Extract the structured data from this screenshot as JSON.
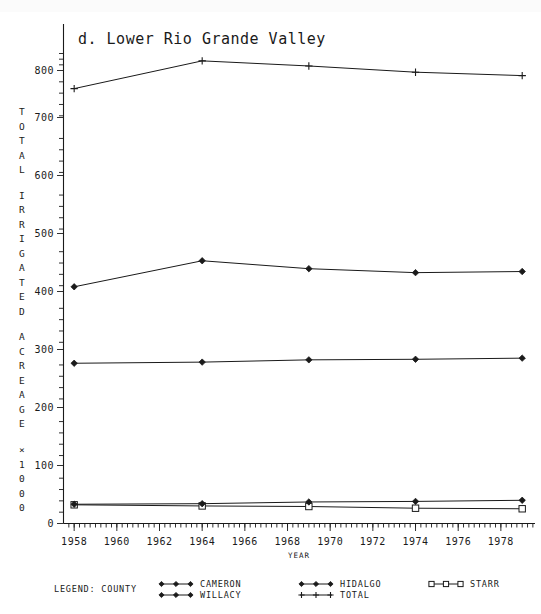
{
  "chart_data": {
    "type": "line",
    "title": "d. Lower Rio Grande Valley",
    "xlabel": "YEAR",
    "ylabel": "TOTAL IRRIGATED ACREAGE",
    "ylabel_units": "1000",
    "ylabel_multiplier_symbol": "×",
    "x": [
      1958,
      1964,
      1969,
      1974,
      1979
    ],
    "xlim": [
      1957.5,
      1979.5
    ],
    "ylim": [
      0,
      830
    ],
    "xticks": [
      1958,
      1960,
      1962,
      1964,
      1966,
      1968,
      1970,
      1972,
      1974,
      1976,
      1978
    ],
    "yticks": [
      0,
      100,
      200,
      300,
      400,
      500,
      600,
      700,
      800
    ],
    "grid": false,
    "legend_position": "bottom",
    "legend_title": "LEGEND: COUNTY",
    "series": [
      {
        "name": "CAMERON",
        "marker": "diamond",
        "values": [
          283,
          285,
          289,
          290,
          292
        ]
      },
      {
        "name": "HIDALGO",
        "marker": "diamond",
        "values": [
          418,
          464,
          450,
          443,
          445
        ]
      },
      {
        "name": "STARR",
        "marker": "square",
        "values": [
          33,
          31,
          30,
          27,
          26
        ]
      },
      {
        "name": "WILLACY",
        "marker": "diamond",
        "values": [
          34,
          35,
          38,
          39,
          41
        ]
      },
      {
        "name": "TOTAL",
        "marker": "plus",
        "values": [
          768,
          817,
          808,
          797,
          791
        ]
      }
    ]
  },
  "legend": {
    "title": "LEGEND: COUNTY",
    "entries": [
      {
        "label": "CAMERON",
        "marker": "diamond"
      },
      {
        "label": "HIDALGO",
        "marker": "diamond"
      },
      {
        "label": "STARR",
        "marker": "square"
      },
      {
        "label": "WILLACY",
        "marker": "diamond"
      },
      {
        "label": "TOTAL",
        "marker": "plus"
      }
    ]
  },
  "axis": {
    "y_title_chars": [
      "T",
      "O",
      "T",
      "A",
      "L",
      "",
      "I",
      "R",
      "R",
      "I",
      "G",
      "A",
      "T",
      "E",
      "D",
      "",
      "A",
      "C",
      "R",
      "E",
      "A",
      "G",
      "E",
      "",
      "×",
      "1",
      "0",
      "0",
      "0"
    ],
    "x_title": "YEAR"
  }
}
